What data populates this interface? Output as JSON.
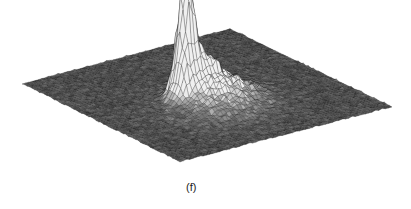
{
  "figure": {
    "panel_label": "(f)",
    "type": "3d-surface-mesh",
    "colors": {
      "mesh_dark": "#1e1e1e",
      "mesh_light": "#f2f2f2",
      "background": "#ffffff"
    }
  },
  "chart_data": {
    "type": "surface",
    "title": "",
    "xlabel": "",
    "ylabel": "",
    "zlabel": "",
    "grid_resolution": [
      64,
      64
    ],
    "background_noise": 0.06,
    "peaks": [
      {
        "u": 0.42,
        "v": 0.5,
        "height": 1.0,
        "width": 0.022
      },
      {
        "u": 0.4,
        "v": 0.47,
        "height": 0.78,
        "width": 0.025
      },
      {
        "u": 0.44,
        "v": 0.46,
        "height": 0.7,
        "width": 0.025
      },
      {
        "u": 0.38,
        "v": 0.52,
        "height": 0.55,
        "width": 0.03
      },
      {
        "u": 0.47,
        "v": 0.52,
        "height": 0.4,
        "width": 0.05
      },
      {
        "u": 0.55,
        "v": 0.55,
        "height": 0.22,
        "width": 0.1
      },
      {
        "u": 0.45,
        "v": 0.62,
        "height": 0.18,
        "width": 0.12
      }
    ]
  }
}
